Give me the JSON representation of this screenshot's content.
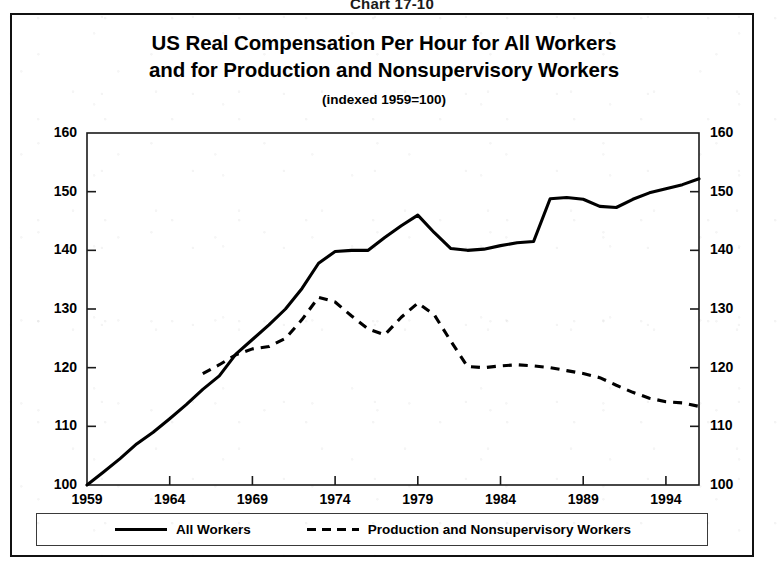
{
  "chart_number": "Chart 17-10",
  "title": {
    "line1": "US Real Compensation Per Hour for All Workers",
    "line2": "and for Production and Nonsupervisory Workers"
  },
  "subtitle": "(indexed 1959=100)",
  "legend": {
    "all_workers_label": "All Workers",
    "production_label": "Production and Nonsupervisory Workers"
  },
  "axes": {
    "y_ticks": [
      "160",
      "150",
      "140",
      "130",
      "120",
      "110",
      "100"
    ],
    "x_ticks": [
      "1959",
      "1964",
      "1969",
      "1974",
      "1979",
      "1984",
      "1989",
      "1994"
    ]
  },
  "colors": {
    "line": "#000000",
    "frame": "#111111",
    "background": "#ffffff"
  },
  "chart_data": {
    "type": "line",
    "title": "US Real Compensation Per Hour for All Workers and for Production and Nonsupervisory Workers",
    "subtitle": "(indexed 1959=100)",
    "xlabel": "",
    "ylabel": "",
    "xlim": [
      1959,
      1996
    ],
    "ylim": [
      100,
      160
    ],
    "y_ticks": [
      100,
      110,
      120,
      130,
      140,
      150,
      160
    ],
    "x_ticks": [
      1959,
      1964,
      1969,
      1974,
      1979,
      1984,
      1989,
      1994
    ],
    "grid": false,
    "legend_position": "bottom",
    "series": [
      {
        "name": "All Workers",
        "style": "solid",
        "x": [
          1959,
          1960,
          1961,
          1962,
          1963,
          1964,
          1965,
          1966,
          1967,
          1968,
          1969,
          1970,
          1971,
          1972,
          1973,
          1974,
          1975,
          1976,
          1977,
          1978,
          1979,
          1980,
          1981,
          1982,
          1983,
          1984,
          1985,
          1986,
          1987,
          1988,
          1989,
          1990,
          1991,
          1992,
          1993,
          1994,
          1995,
          1996
        ],
        "values": [
          100.0,
          102.2,
          104.5,
          107.0,
          109.0,
          111.3,
          113.7,
          116.3,
          118.6,
          122.3,
          124.8,
          127.3,
          130.0,
          133.5,
          137.8,
          139.8,
          140.0,
          140.0,
          142.2,
          144.2,
          146.0,
          143.0,
          140.3,
          140.0,
          140.2,
          140.8,
          141.3,
          141.5,
          148.8,
          149.0,
          148.7,
          147.5,
          147.3,
          148.7,
          149.8,
          150.5,
          151.2,
          152.2
        ]
      },
      {
        "name": "Production and Nonsupervisory Workers",
        "style": "dashed",
        "x": [
          1966,
          1967,
          1968,
          1969,
          1970,
          1971,
          1972,
          1973,
          1974,
          1975,
          1976,
          1977,
          1978,
          1979,
          1980,
          1981,
          1982,
          1983,
          1984,
          1985,
          1986,
          1987,
          1988,
          1989,
          1990,
          1991,
          1992,
          1993,
          1994,
          1995,
          1996
        ],
        "values": [
          119.0,
          120.5,
          122.2,
          123.2,
          123.6,
          125.0,
          128.2,
          132.0,
          131.2,
          128.8,
          126.6,
          125.6,
          128.6,
          131.0,
          129.0,
          124.5,
          120.2,
          120.0,
          120.3,
          120.5,
          120.3,
          120.0,
          119.5,
          119.0,
          118.3,
          117.0,
          115.8,
          114.8,
          114.2,
          114.0,
          113.4
        ]
      }
    ]
  }
}
